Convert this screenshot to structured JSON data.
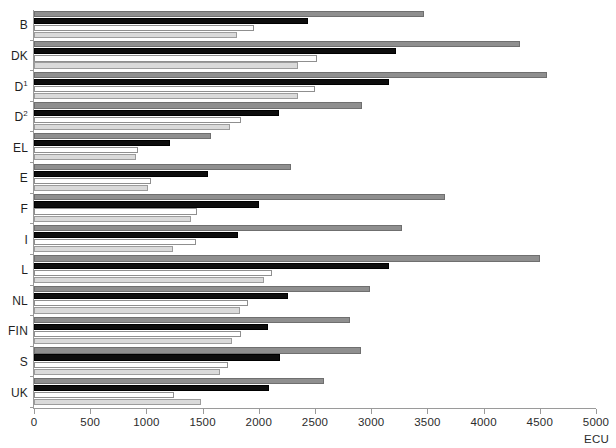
{
  "chart_data": {
    "type": "bar",
    "orientation": "horizontal",
    "title": "",
    "xlabel": "ECU",
    "ylabel": "",
    "xlim": [
      0,
      5000
    ],
    "grid": false,
    "legend": "none",
    "xticks": [
      0,
      500,
      1000,
      1500,
      2000,
      2500,
      3000,
      3500,
      4000,
      4500,
      5000
    ],
    "xticklabels": [
      "0",
      "500",
      "1000",
      "1500",
      "2000",
      "2500",
      "3000",
      "3500",
      "4000",
      "4500",
      "5000"
    ],
    "unit_label": "ECU",
    "categories": [
      "B",
      "DK",
      "D¹",
      "D²",
      "EL",
      "E",
      "F",
      "I",
      "L",
      "NL",
      "FIN",
      "S",
      "UK"
    ],
    "category_labels": [
      {
        "text": "B",
        "sup": ""
      },
      {
        "text": "DK",
        "sup": ""
      },
      {
        "text": "D",
        "sup": "1"
      },
      {
        "text": "D",
        "sup": "2"
      },
      {
        "text": "EL",
        "sup": ""
      },
      {
        "text": "E",
        "sup": ""
      },
      {
        "text": "F",
        "sup": ""
      },
      {
        "text": "I",
        "sup": ""
      },
      {
        "text": "L",
        "sup": ""
      },
      {
        "text": "NL",
        "sup": ""
      },
      {
        "text": "FIN",
        "sup": ""
      },
      {
        "text": "S",
        "sup": ""
      },
      {
        "text": "UK",
        "sup": ""
      }
    ],
    "series": [
      {
        "name": "series-1",
        "color": "#8f8f8f",
        "values": [
          3470,
          4320,
          4560,
          2920,
          1575,
          2285,
          3655,
          3270,
          4500,
          2990,
          2810,
          2905,
          2580
        ]
      },
      {
        "name": "series-2",
        "color": "#0d0d0d",
        "values": [
          2435,
          3225,
          3160,
          2180,
          1210,
          1545,
          2005,
          1815,
          3155,
          2260,
          2080,
          2185,
          2090
        ]
      },
      {
        "name": "series-3",
        "color": "#ffffff",
        "values": [
          1955,
          2515,
          2500,
          1845,
          925,
          1040,
          1450,
          1440,
          2115,
          1900,
          1840,
          1730,
          1245
        ]
      },
      {
        "name": "series-4",
        "color": "#dadada",
        "values": [
          1810,
          2350,
          2345,
          1745,
          905,
          1015,
          1395,
          1235,
          2050,
          1830,
          1760,
          1655,
          1490
        ]
      }
    ]
  }
}
